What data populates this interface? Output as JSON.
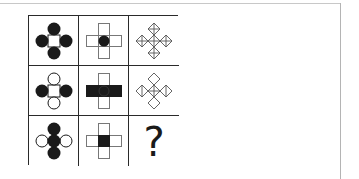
{
  "puzzle": {
    "type": "3x3 figure matrix",
    "rows": [
      {
        "cells": [
          {
            "id": "r1c1",
            "figure": "circle-cross",
            "center": "white-square",
            "top": "black-circle",
            "left": "black-circle",
            "right": "black-circle",
            "bottom": "black-circle"
          },
          {
            "id": "r1c2",
            "figure": "rect-cross",
            "center": "black-circle",
            "top": "open-rect",
            "left": "open-rect",
            "right": "open-rect",
            "bottom": "open-rect"
          },
          {
            "id": "r1c3",
            "figure": "diamond-cross",
            "center": "diamond-plus",
            "top": "diamond-plus",
            "left": "diamond-plus",
            "right": "diamond-plus",
            "bottom": "diamond-plus"
          }
        ]
      },
      {
        "cells": [
          {
            "id": "r2c1",
            "figure": "circle-cross",
            "center": "white-square",
            "top": "open-circle",
            "left": "black-circle",
            "right": "black-circle",
            "bottom": "open-circle"
          },
          {
            "id": "r2c2",
            "figure": "rect-cross",
            "center": "black-square",
            "top": "open-rect",
            "left": "black-rect",
            "right": "black-rect",
            "bottom": "open-rect"
          },
          {
            "id": "r2c3",
            "figure": "diamond-cross",
            "center": "diamond-plus",
            "top": "diamond-plain",
            "left": "diamond-vline",
            "right": "diamond-vline",
            "bottom": "diamond-plain"
          }
        ]
      },
      {
        "cells": [
          {
            "id": "r3c1",
            "figure": "circle-cross",
            "center": "black-circle",
            "top": "black-circle",
            "left": "open-circle",
            "right": "open-circle",
            "bottom": "black-circle"
          },
          {
            "id": "r3c2",
            "figure": "rect-cross",
            "center": "black-square",
            "top": "open-rect",
            "left": "open-rect",
            "right": "open-rect",
            "bottom": "open-rect"
          },
          {
            "id": "r3c3",
            "figure": "unknown",
            "label": "?"
          }
        ]
      }
    ],
    "missing_label": "?"
  },
  "colors": {
    "ink": "#1a1a1a",
    "grid_line": "#2a2a2a",
    "frame_line": "#c8c8c8",
    "background": "#ffffff"
  }
}
